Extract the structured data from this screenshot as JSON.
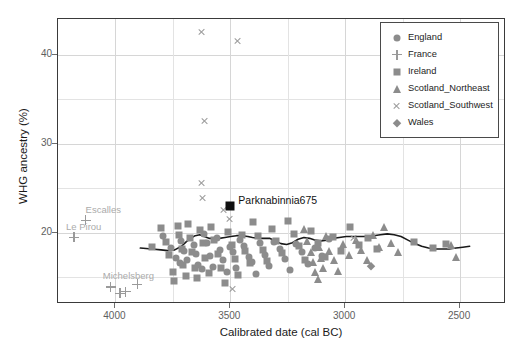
{
  "chart_data": {
    "type": "scatter",
    "title": "",
    "xlabel": "Calibrated date (cal BC)",
    "ylabel": "WHG ancestry (%)",
    "xlim": [
      4250,
      2300
    ],
    "ylim": [
      12,
      44
    ],
    "x_axis_reversed": true,
    "xticks": [
      4000,
      3500,
      3000,
      2500
    ],
    "yticks": [
      20,
      30,
      40
    ],
    "grid": true,
    "legend_position": "top-right",
    "colors": {
      "marker_gray": "#8c8c8c",
      "cross_gray": "#9a9a9a",
      "highlight": "#101010",
      "trend_line": "#1a1a1a",
      "grid": "#e3e3e3",
      "frame": "#3a3a3a",
      "annotation_gray": "#ababab"
    },
    "legend": [
      {
        "label": "England",
        "marker": "circle"
      },
      {
        "label": "France",
        "marker": "plus"
      },
      {
        "label": "Ireland",
        "marker": "square"
      },
      {
        "label": "Scotland_Northeast",
        "marker": "triangle"
      },
      {
        "label": "Scotland_Southwest",
        "marker": "ex"
      },
      {
        "label": "Wales",
        "marker": "diamond"
      }
    ],
    "series": [
      {
        "name": "England",
        "marker": "circle",
        "points": [
          [
            3795,
            19.6
          ],
          [
            3760,
            18.3
          ],
          [
            3735,
            17.2
          ],
          [
            3720,
            16.6
          ],
          [
            3715,
            19.1
          ],
          [
            3700,
            18.0
          ],
          [
            3690,
            16.9
          ],
          [
            3660,
            18.6
          ],
          [
            3650,
            17.6
          ],
          [
            3640,
            16.4
          ],
          [
            3625,
            15.9
          ],
          [
            3615,
            19.9
          ],
          [
            3600,
            18.8
          ],
          [
            3590,
            17.4
          ],
          [
            3575,
            16.2
          ],
          [
            3560,
            19.4
          ],
          [
            3545,
            18.1
          ],
          [
            3530,
            17.0
          ],
          [
            3515,
            15.6
          ],
          [
            3500,
            18.4
          ],
          [
            3490,
            17.8
          ],
          [
            3475,
            16.0
          ],
          [
            3460,
            19.2
          ],
          [
            3440,
            18.5
          ],
          [
            3420,
            17.3
          ],
          [
            3405,
            16.7
          ],
          [
            3390,
            15.4
          ],
          [
            3370,
            18.9
          ],
          [
            3350,
            17.5
          ],
          [
            3330,
            16.3
          ],
          [
            3310,
            19.0
          ],
          [
            3285,
            18.2
          ],
          [
            3260,
            17.1
          ],
          [
            3240,
            15.8
          ],
          [
            3215,
            18.7
          ],
          [
            3190,
            17.9
          ],
          [
            3160,
            16.5
          ],
          [
            3130,
            18.3
          ],
          [
            3100,
            17.4
          ],
          [
            3070,
            19.3
          ]
        ]
      },
      {
        "name": "France",
        "marker": "plus",
        "points": [
          [
            4130,
            21.4
          ],
          [
            4180,
            19.5
          ],
          [
            4020,
            13.9
          ],
          [
            3980,
            13.2
          ],
          [
            3955,
            13.4
          ],
          [
            3905,
            14.2
          ]
        ]
      },
      {
        "name": "Ireland",
        "marker": "square",
        "points": [
          [
            3840,
            18.4
          ],
          [
            3800,
            20.5
          ],
          [
            3780,
            19.0
          ],
          [
            3765,
            17.5
          ],
          [
            3750,
            15.6
          ],
          [
            3745,
            14.6
          ],
          [
            3730,
            20.8
          ],
          [
            3725,
            19.7
          ],
          [
            3710,
            18.2
          ],
          [
            3705,
            16.4
          ],
          [
            3695,
            15.1
          ],
          [
            3685,
            21.0
          ],
          [
            3675,
            19.4
          ],
          [
            3665,
            17.8
          ],
          [
            3655,
            16.1
          ],
          [
            3645,
            14.9
          ],
          [
            3630,
            20.3
          ],
          [
            3620,
            18.9
          ],
          [
            3610,
            17.2
          ],
          [
            3595,
            15.5
          ],
          [
            3585,
            20.6
          ],
          [
            3570,
            19.2
          ],
          [
            3555,
            17.6
          ],
          [
            3540,
            16.0
          ],
          [
            3525,
            14.4
          ],
          [
            3510,
            20.1
          ],
          [
            3495,
            18.6
          ],
          [
            3480,
            17.1
          ],
          [
            3465,
            15.3
          ],
          [
            3450,
            19.8
          ],
          [
            3435,
            18.0
          ],
          [
            3415,
            16.6
          ],
          [
            3400,
            21.2
          ],
          [
            3380,
            19.6
          ],
          [
            3360,
            18.1
          ],
          [
            3340,
            16.8
          ],
          [
            3320,
            20.4
          ],
          [
            3300,
            19.1
          ],
          [
            3275,
            17.7
          ],
          [
            3250,
            21.3
          ],
          [
            3225,
            19.9
          ],
          [
            3200,
            18.5
          ],
          [
            3175,
            17.0
          ],
          [
            3150,
            20.2
          ],
          [
            3120,
            18.8
          ],
          [
            3090,
            17.3
          ],
          [
            3055,
            19.5
          ],
          [
            3020,
            18.0
          ],
          [
            2980,
            20.7
          ],
          [
            2940,
            18.6
          ],
          [
            2900,
            19.4
          ],
          [
            2860,
            18.2
          ],
          [
            2700,
            19.0
          ],
          [
            2620,
            18.3
          ],
          [
            2560,
            18.7
          ]
        ]
      },
      {
        "name": "Scotland_Northeast",
        "marker": "triangle",
        "points": [
          [
            3180,
            20.4
          ],
          [
            3165,
            19.1
          ],
          [
            3150,
            17.9
          ],
          [
            3140,
            16.7
          ],
          [
            3130,
            15.6
          ],
          [
            3120,
            14.8
          ],
          [
            3115,
            18.4
          ],
          [
            3105,
            17.2
          ],
          [
            3095,
            16.1
          ],
          [
            3085,
            19.6
          ],
          [
            3070,
            18.0
          ],
          [
            3050,
            16.9
          ],
          [
            3030,
            15.7
          ],
          [
            3010,
            18.7
          ],
          [
            2985,
            17.5
          ],
          [
            2955,
            19.2
          ],
          [
            2930,
            18.1
          ],
          [
            2905,
            17.0
          ],
          [
            2880,
            19.8
          ],
          [
            2855,
            18.4
          ],
          [
            2830,
            20.6
          ],
          [
            2800,
            18.9
          ],
          [
            2770,
            17.8
          ],
          [
            2540,
            18.6
          ],
          [
            2520,
            17.3
          ]
        ]
      },
      {
        "name": "Scotland_Southwest",
        "marker": "ex",
        "points": [
          [
            3625,
            42.6
          ],
          [
            3470,
            41.5
          ],
          [
            3610,
            32.6
          ],
          [
            3625,
            25.6
          ],
          [
            3620,
            23.9
          ],
          [
            3530,
            22.6
          ],
          [
            3505,
            21.5
          ],
          [
            3490,
            13.7
          ],
          [
            2965,
            19.4
          ]
        ]
      },
      {
        "name": "Wales",
        "marker": "diamond",
        "points": [
          [
            2890,
            16.3
          ]
        ]
      }
    ],
    "highlight_point": {
      "label": "Parknabinnia675",
      "x": 3500,
      "y": 23.0,
      "marker": "filled-square",
      "series": "Ireland"
    },
    "site_annotations": [
      {
        "label": "Escalles",
        "x": 4130,
        "y": 22.6
      },
      {
        "label": "Le Pirou",
        "x": 4215,
        "y": 20.6
      },
      {
        "label": "Michelsberg",
        "x": 4055,
        "y": 15.2
      }
    ],
    "trend_line": {
      "name": "Loess smoother",
      "points": [
        [
          3890,
          18.1
        ],
        [
          3840,
          18.0
        ],
        [
          3800,
          17.9
        ],
        [
          3770,
          17.8
        ],
        [
          3740,
          17.9
        ],
        [
          3710,
          18.3
        ],
        [
          3690,
          18.8
        ],
        [
          3670,
          19.2
        ],
        [
          3650,
          19.5
        ],
        [
          3630,
          19.6
        ],
        [
          3610,
          19.4
        ],
        [
          3590,
          19.2
        ],
        [
          3570,
          19.2
        ],
        [
          3545,
          19.2
        ],
        [
          3520,
          19.3
        ],
        [
          3495,
          19.4
        ],
        [
          3470,
          19.5
        ],
        [
          3445,
          19.5
        ],
        [
          3420,
          19.4
        ],
        [
          3400,
          19.3
        ],
        [
          3375,
          19.2
        ],
        [
          3350,
          19.2
        ],
        [
          3325,
          19.2
        ],
        [
          3300,
          18.9
        ],
        [
          3275,
          18.6
        ],
        [
          3250,
          18.5
        ],
        [
          3225,
          18.7
        ],
        [
          3200,
          19.1
        ],
        [
          3175,
          19.3
        ],
        [
          3150,
          19.2
        ],
        [
          3125,
          19.0
        ],
        [
          3100,
          18.9
        ],
        [
          3075,
          19.0
        ],
        [
          3050,
          19.2
        ],
        [
          3020,
          19.3
        ],
        [
          2990,
          19.4
        ],
        [
          2960,
          19.4
        ],
        [
          2930,
          19.4
        ],
        [
          2900,
          19.4
        ],
        [
          2870,
          19.5
        ],
        [
          2840,
          19.6
        ],
        [
          2810,
          19.7
        ],
        [
          2780,
          19.6
        ],
        [
          2750,
          19.4
        ],
        [
          2720,
          19.0
        ],
        [
          2690,
          18.6
        ],
        [
          2660,
          18.3
        ],
        [
          2630,
          18.1
        ],
        [
          2600,
          18.0
        ],
        [
          2570,
          18.0
        ],
        [
          2540,
          18.0
        ],
        [
          2510,
          18.1
        ],
        [
          2480,
          18.2
        ],
        [
          2450,
          18.3
        ]
      ]
    }
  }
}
